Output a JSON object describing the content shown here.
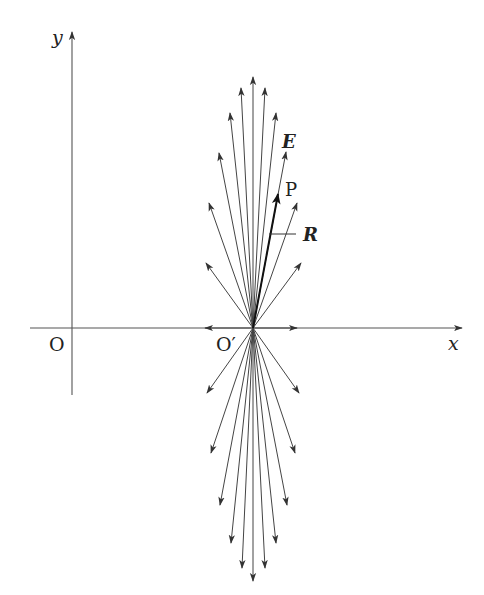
{
  "figure": {
    "colors": {
      "line": "#444444",
      "axis": "#555555",
      "text": "#222222"
    }
  },
  "axes": {
    "x_label": "x",
    "y_label": "y",
    "origin_label": "O",
    "charge_origin_label": "O′"
  },
  "labels": {
    "field": "E",
    "point": "P",
    "radius_vector": "R"
  },
  "geometry": {
    "center": [
      253,
      328
    ],
    "origin": [
      72,
      328
    ],
    "field_line_tips": [
      [
        253,
        77
      ],
      [
        241,
        88
      ],
      [
        265,
        88
      ],
      [
        230,
        113
      ],
      [
        276,
        113
      ],
      [
        219,
        153
      ],
      [
        286,
        152
      ],
      [
        209,
        203
      ],
      [
        297,
        203
      ],
      [
        206,
        263
      ],
      [
        301,
        263
      ],
      [
        205,
        328
      ],
      [
        297,
        328
      ],
      [
        207,
        393
      ],
      [
        299,
        393
      ],
      [
        211,
        453
      ],
      [
        295,
        453
      ],
      [
        220,
        505
      ],
      [
        287,
        505
      ],
      [
        231,
        543
      ],
      [
        276,
        543
      ],
      [
        242,
        568
      ],
      [
        265,
        568
      ],
      [
        253,
        581
      ]
    ],
    "point_P": [
      278,
      194
    ]
  }
}
